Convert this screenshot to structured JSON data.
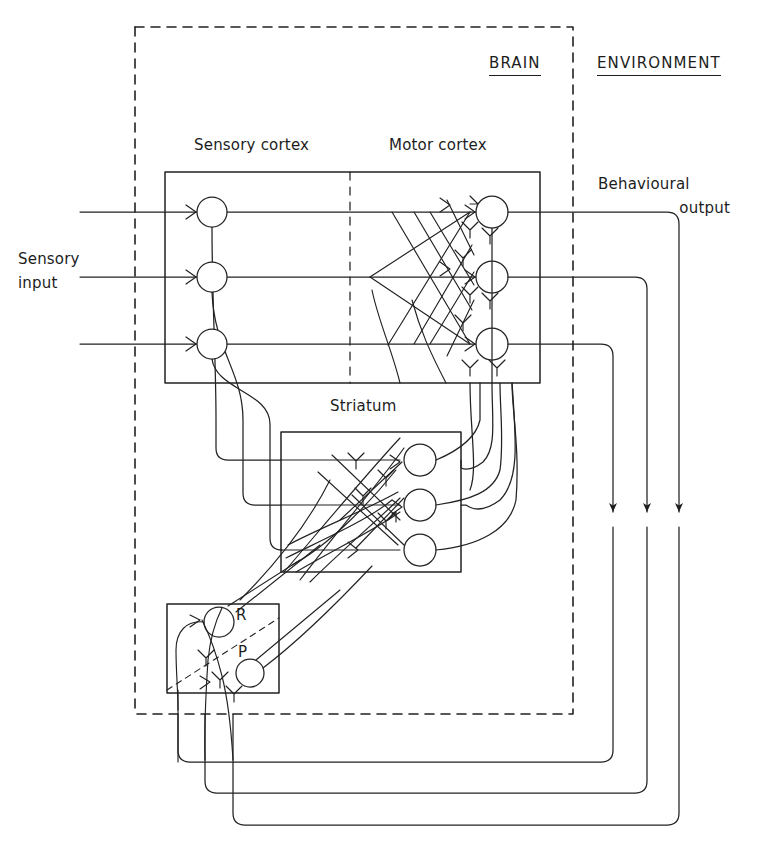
{
  "figure": {
    "domains": {
      "brain": "BRAIN",
      "environment": "ENVIRONMENT"
    },
    "regions": {
      "sensory_cortex": "Sensory cortex",
      "motor_cortex": "Motor cortex",
      "striatum": "Striatum",
      "reinforcement_box": ""
    },
    "io": {
      "sensory_input_line1": "Sensory",
      "sensory_input_line2": "input",
      "behavioural_output_line1": "Behavioural",
      "behavioural_output_line2": "output"
    },
    "nodes": {
      "reward": "R",
      "punishment": "P"
    },
    "colors": {
      "ink": "#1d1d1d",
      "line": "#222222",
      "background": "#ffffff"
    },
    "counts": {
      "sensory_neurons": 3,
      "motor_neurons": 3,
      "striatal_neurons": 3,
      "output_channels": 3,
      "input_channels": 3
    }
  },
  "geometry": {
    "brain_boundary": {
      "x": 135,
      "y": 27,
      "w": 438,
      "h": 687
    },
    "cortex_box": {
      "x": 165,
      "y": 172,
      "w": 375,
      "h": 211
    },
    "cortex_divider_x": 350,
    "striatum_box": {
      "x": 281,
      "y": 432,
      "w": 180,
      "h": 140
    },
    "rp_box": {
      "x": 167,
      "y": 604,
      "w": 112,
      "h": 89
    },
    "sensory_neuron_x": 212,
    "motor_neuron_x": 492,
    "striatal_neuron_x": 420,
    "row_y": [
      212,
      277,
      344
    ],
    "striatum_row_y": [
      460,
      505,
      550
    ],
    "output_arrow_x": [
      613,
      647,
      679
    ],
    "output_arrow_tip_y": 527,
    "feedback_levels_y": [
      762,
      793,
      825
    ],
    "feedback_up_x": [
      178,
      205,
      233
    ]
  }
}
